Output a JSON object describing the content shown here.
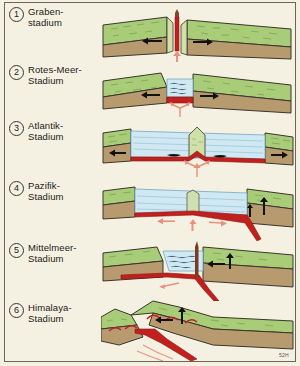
{
  "figure": {
    "code": "52H",
    "background_color": "#f4f1e2",
    "border_color": "#6b6658"
  },
  "palette": {
    "vegetation_green": "#a8cc78",
    "vegetation_green_dark": "#6f9a46",
    "crust_brown": "#b79a6e",
    "crust_brown_dark": "#8d7249",
    "water_blue": "#cfe8f2",
    "water_line": "#6fa8c4",
    "magma_red": "#c0211f",
    "magma_arrow_pink": "#e8917f",
    "motion_arrow_black": "#111111",
    "outline": "#3a362c"
  },
  "panels": [
    {
      "number": "1",
      "label": "Graben-\nstadium",
      "stage_name": "Graben-stadium",
      "description": "Rift valley stage: continental crust thins and splits, magma rises into a narrow central dike, blocks move apart.",
      "has_ocean": false,
      "arrows": {
        "divergence": 2,
        "magma_up": 1
      }
    },
    {
      "number": "2",
      "label": "Rotes-Meer-\nStadium",
      "stage_name": "Rotes-Meer-Stadium",
      "description": "Red Sea stage: the rift floods with a narrow sea, new basaltic crust forms at the floor.",
      "has_ocean": true,
      "arrows": {
        "divergence": 2,
        "magma_up": 1
      }
    },
    {
      "number": "3",
      "label": "Atlantik-\nStadium",
      "stage_name": "Atlantik-Stadium",
      "description": "Atlantic stage: a wide ocean with a central mid-ocean ridge spreading symmetrically, passive margins.",
      "has_ocean": true,
      "arrows": {
        "divergence": 2,
        "magma_up": 1,
        "ridge_flank": 2
      }
    },
    {
      "number": "4",
      "label": "Pazifik-\nStadium",
      "stage_name": "Pazifik-Stadium",
      "description": "Pacific stage: subduction begins, oceanic crust dives beneath the right-hand continental margin.",
      "has_ocean": true,
      "arrows": {
        "spreading": 2,
        "magma_up": 1,
        "uplift": 1
      }
    },
    {
      "number": "5",
      "label": "Mittelmeer-\nStadium",
      "stage_name": "Mittelmeer-Stadium",
      "description": "Mediterranean stage: the ocean basin narrows as subduction consumes the sea floor, volcanism at the margin.",
      "has_ocean": true,
      "arrows": {
        "convergence": 1,
        "uplift": 1,
        "subduction": 1
      }
    },
    {
      "number": "6",
      "label": "Himalaya-\nStadium",
      "stage_name": "Himalaya-Stadium",
      "description": "Himalaya stage: continents collide, the ocean is closed and crust is folded and uplifted into mountains.",
      "has_ocean": false,
      "arrows": {
        "convergence": 1,
        "uplift": 1
      }
    }
  ]
}
